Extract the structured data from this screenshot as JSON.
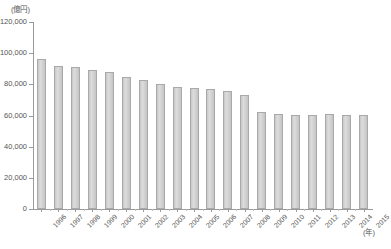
{
  "chart_data": {
    "type": "bar",
    "title": "",
    "subtitle": "",
    "unit_label": "(億円)",
    "xlabel": "(年)",
    "ylabel": "",
    "ylim": [
      0,
      120000
    ],
    "ytick_step": 20000,
    "grid": false,
    "legend": null,
    "categories": [
      "1996",
      "1997",
      "1998",
      "1999",
      "2000",
      "2001",
      "2002",
      "2003",
      "2004",
      "2005",
      "2006",
      "2007",
      "2008",
      "2009",
      "2010",
      "2011",
      "2012",
      "2013",
      "2014",
      "2015"
    ],
    "values": [
      96500,
      91500,
      91300,
      89300,
      88000,
      85000,
      82500,
      80000,
      78000,
      77500,
      77000,
      76000,
      73000,
      62500,
      61000,
      60500,
      60500,
      60800,
      60500,
      60500
    ],
    "ytick_labels": [
      "0",
      "20,000",
      "40,000",
      "60,000",
      "80,000",
      "100,000",
      "120,000"
    ],
    "ytick_values": [
      0,
      20000,
      40000,
      60000,
      80000,
      100000,
      120000
    ],
    "bar_color": "#d2d2d2",
    "bar_border_color": "#a9a9a9",
    "axis_color": "#9a9a9a",
    "text_color": "#555555"
  }
}
